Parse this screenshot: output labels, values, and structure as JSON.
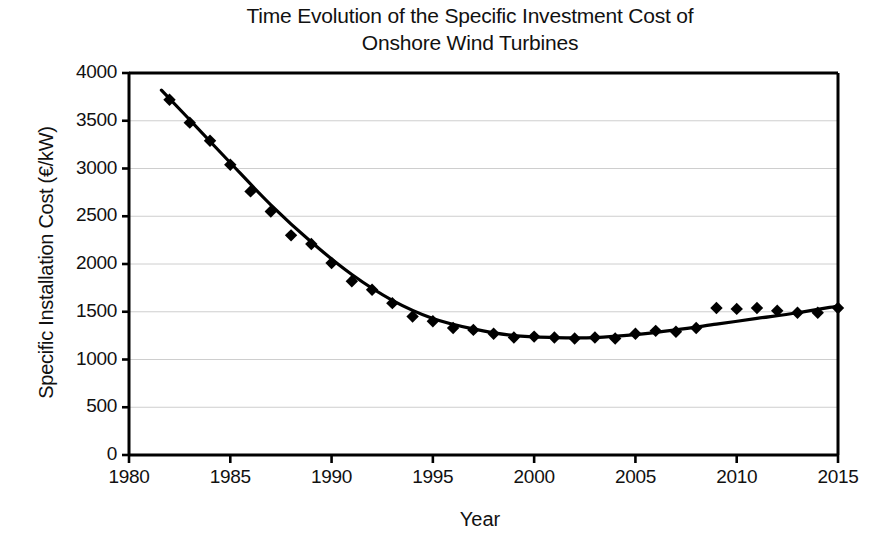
{
  "chart_data": {
    "type": "scatter",
    "title": "Time Evolution of the Specific Investment Cost of Onshore Wind Turbines",
    "title_lines": [
      "Time Evolution of the Specific Investment Cost of",
      "Onshore Wind Turbines"
    ],
    "xlabel": "Year",
    "ylabel": "Specific Installation Cost (€/kW)",
    "xlim": [
      1980,
      2015
    ],
    "ylim": [
      0,
      4000
    ],
    "xticks": [
      1980,
      1985,
      1990,
      1995,
      2000,
      2005,
      2010,
      2015
    ],
    "xtick_labels": [
      "1980",
      "1985",
      "1990",
      "1995",
      "2000",
      "2005",
      "2010",
      "2015"
    ],
    "yticks": [
      0,
      500,
      1000,
      1500,
      2000,
      2500,
      3000,
      3500,
      4000
    ],
    "ytick_labels": [
      "0",
      "500",
      "1000",
      "1500",
      "2000",
      "2500",
      "3000",
      "3500",
      "4000"
    ],
    "grid": "horizontal",
    "grid_color": "#c8c8c8",
    "legend": "none",
    "marker": "diamond",
    "marker_color": "#000000",
    "line_color": "#000000",
    "series": [
      {
        "name": "Specific installation cost data points",
        "x": [
          1982,
          1983,
          1984,
          1985,
          1986,
          1987,
          1988,
          1989,
          1990,
          1991,
          1992,
          1993,
          1994,
          1995,
          1996,
          1997,
          1998,
          1999,
          2000,
          2001,
          2002,
          2003,
          2004,
          2005,
          2006,
          2007,
          2008,
          2009,
          2010,
          2011,
          2012,
          2013,
          2014,
          2015
        ],
        "y": [
          3720,
          3480,
          3290,
          3040,
          2760,
          2550,
          2300,
          2210,
          2010,
          1820,
          1730,
          1590,
          1450,
          1400,
          1330,
          1310,
          1270,
          1230,
          1240,
          1230,
          1220,
          1230,
          1220,
          1270,
          1300,
          1290,
          1330,
          1540,
          1530,
          1540,
          1510,
          1490,
          1490,
          1540
        ]
      },
      {
        "name": "Trend line",
        "type": "line",
        "x": [
          1981.6,
          1983,
          1985,
          1987,
          1989,
          1991,
          1993,
          1995,
          1997,
          1999,
          2001,
          2003,
          2005,
          2007,
          2009,
          2011,
          2013,
          2015
        ],
        "y": [
          3820,
          3510,
          3060,
          2620,
          2230,
          1890,
          1620,
          1430,
          1320,
          1250,
          1230,
          1230,
          1260,
          1310,
          1370,
          1430,
          1490,
          1560
        ]
      }
    ]
  },
  "axes": {
    "frame_color": "#000000",
    "background": "#ffffff"
  }
}
